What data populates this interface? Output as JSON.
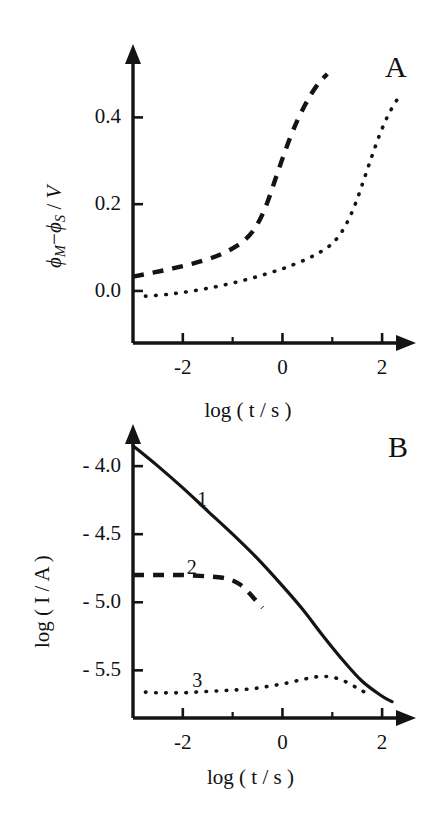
{
  "figure": {
    "background": "#ffffff",
    "ink_color": "#141414",
    "panels": [
      "A",
      "B"
    ]
  },
  "panel_a": {
    "letter": "A",
    "x_axis_title": "log ( t / s )",
    "y_axis_title_parts": {
      "phi1": "ϕ",
      "sub1": "M",
      "minus": "−",
      "phi2": "ϕ",
      "sub2": "S",
      "slash": " / ",
      "unit": "V"
    },
    "y_tick_labels": [
      "0.4",
      "0.2",
      "0.0"
    ],
    "x_tick_labels": [
      "-2",
      "0",
      "2"
    ]
  },
  "panel_b": {
    "letter": "B",
    "x_axis_title": "log ( t / s )",
    "y_axis_title": "log ( I / A )",
    "y_tick_labels": [
      "- 4.0",
      "- 4.5",
      "- 5.0",
      "- 5.5"
    ],
    "x_tick_labels": [
      "-2",
      "0",
      "2"
    ],
    "curve_labels": [
      "1",
      "2",
      "3"
    ]
  },
  "chart_data": [
    {
      "type": "line",
      "title": "A",
      "xlabel": "log ( t / s )",
      "ylabel": "phi_M - phi_S / V",
      "xlim": [
        -3.0,
        2.6
      ],
      "ylim": [
        -0.12,
        0.56
      ],
      "xticks": [
        -2,
        0,
        2
      ],
      "xticks_minor": [
        -1,
        1
      ],
      "yticks": [
        0.0,
        0.2,
        0.4
      ],
      "grid": false,
      "legend": "none",
      "series": [
        {
          "name": "dashed",
          "style": "dashed",
          "x": [
            -3.0,
            -2.6,
            -2.2,
            -1.8,
            -1.4,
            -1.1,
            -0.9,
            -0.75,
            -0.6,
            -0.45,
            -0.3,
            -0.15,
            0.0,
            0.15,
            0.3,
            0.45,
            0.6,
            0.75,
            0.9
          ],
          "y": [
            0.033,
            0.042,
            0.052,
            0.063,
            0.077,
            0.092,
            0.105,
            0.118,
            0.137,
            0.165,
            0.205,
            0.255,
            0.305,
            0.352,
            0.393,
            0.428,
            0.458,
            0.482,
            0.5
          ]
        },
        {
          "name": "dotted",
          "style": "dotted",
          "x": [
            -2.75,
            -2.4,
            -2.1,
            -1.8,
            -1.5,
            -1.2,
            -0.9,
            -0.6,
            -0.3,
            0.0,
            0.25,
            0.5,
            0.7,
            0.9,
            1.05,
            1.2,
            1.35,
            1.5,
            1.65,
            1.8,
            1.95,
            2.1,
            2.25,
            2.35
          ],
          "y": [
            -0.012,
            -0.009,
            -0.005,
            0.0,
            0.006,
            0.013,
            0.021,
            0.03,
            0.04,
            0.051,
            0.062,
            0.074,
            0.086,
            0.1,
            0.115,
            0.138,
            0.17,
            0.212,
            0.262,
            0.312,
            0.36,
            0.4,
            0.432,
            0.448
          ]
        }
      ]
    },
    {
      "type": "line",
      "title": "B",
      "xlabel": "log ( t / s )",
      "ylabel": "log ( I / A )",
      "xlim": [
        -3.0,
        2.6
      ],
      "ylim": [
        -5.85,
        -3.72
      ],
      "xticks": [
        -2,
        0,
        2
      ],
      "xticks_minor": [
        -1,
        1
      ],
      "yticks": [
        -4.0,
        -4.5,
        -5.0,
        -5.5
      ],
      "grid": false,
      "legend": "inline-labels",
      "series": [
        {
          "name": "1",
          "style": "solid",
          "label": "1",
          "x": [
            -3.0,
            -2.5,
            -2.0,
            -1.5,
            -1.0,
            -0.5,
            0.0,
            0.4,
            0.8,
            1.2,
            1.6,
            2.0,
            2.2
          ],
          "y": [
            -3.85,
            -4.0,
            -4.16,
            -4.33,
            -4.5,
            -4.68,
            -4.88,
            -5.05,
            -5.24,
            -5.42,
            -5.58,
            -5.69,
            -5.73
          ]
        },
        {
          "name": "2",
          "style": "dashed",
          "label": "2",
          "x": [
            -3.0,
            -2.5,
            -2.0,
            -1.5,
            -1.2,
            -1.0,
            -0.85,
            -0.7,
            -0.55,
            -0.4
          ],
          "y": [
            -4.8,
            -4.8,
            -4.8,
            -4.81,
            -4.82,
            -4.84,
            -4.87,
            -4.92,
            -4.98,
            -5.04
          ]
        },
        {
          "name": "3",
          "style": "dotted",
          "label": "3",
          "x": [
            -2.75,
            -2.5,
            -2.25,
            -2.0,
            -1.75,
            -1.5,
            -1.25,
            -1.0,
            -0.75,
            -0.5,
            -0.25,
            0.0,
            0.25,
            0.5,
            0.75,
            1.0,
            1.25,
            1.5,
            1.7
          ],
          "y": [
            -5.66,
            -5.665,
            -5.665,
            -5.665,
            -5.66,
            -5.655,
            -5.65,
            -5.645,
            -5.64,
            -5.63,
            -5.615,
            -5.6,
            -5.58,
            -5.56,
            -5.545,
            -5.55,
            -5.58,
            -5.63,
            -5.67
          ]
        }
      ]
    }
  ]
}
